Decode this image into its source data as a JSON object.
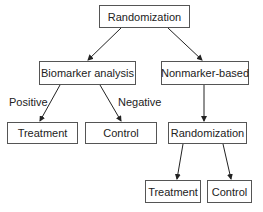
{
  "nodes": {
    "root": "Randomization",
    "biomarker": "Biomarker analysis",
    "nonmarker": "Nonmarker-based",
    "bm_treatment": "Treatment",
    "bm_control": "Control",
    "nm_randomization": "Randomization",
    "nm_treatment": "Treatment",
    "nm_control": "Control"
  },
  "edge_labels": {
    "positive": "Positive",
    "negative": "Negative"
  },
  "colors": {
    "line": "#222222",
    "border": "#555555",
    "background": "#ffffff"
  }
}
